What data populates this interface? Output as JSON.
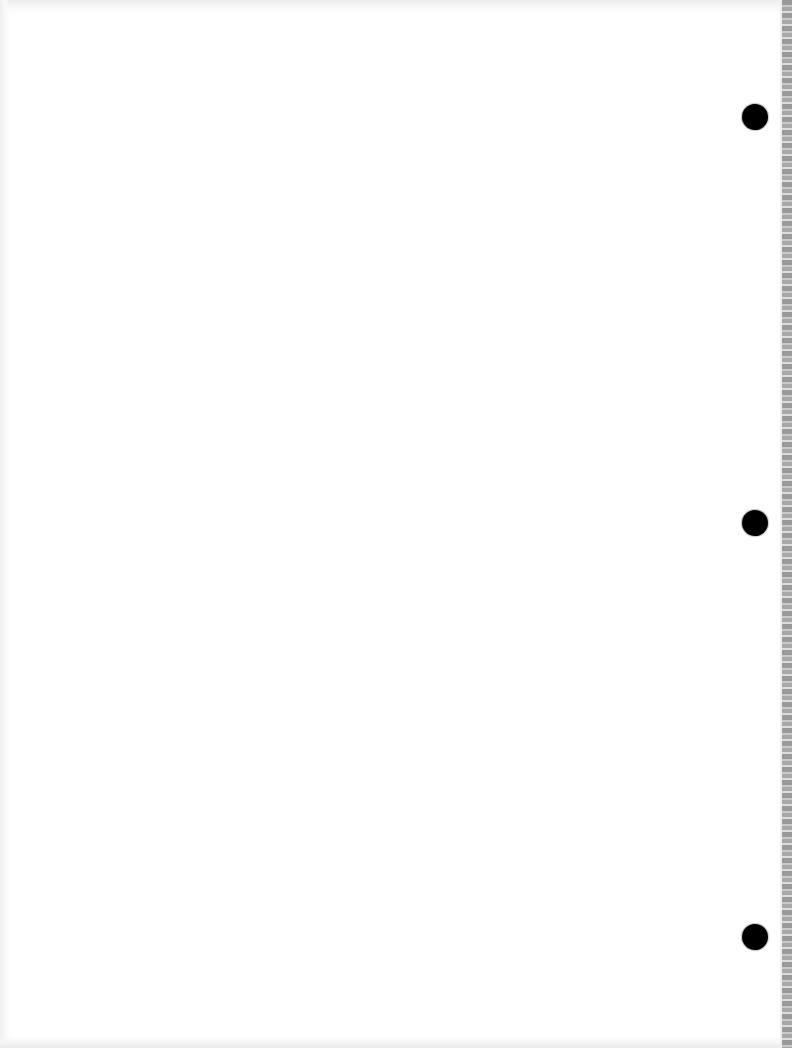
{
  "document": {
    "type": "blank loose-leaf notebook page (scanned)",
    "text_content": "",
    "background_color": "#ffffff"
  },
  "punch_holes": [
    {
      "cx": 755,
      "cy": 117,
      "r": 13,
      "color": "#000000"
    },
    {
      "cx": 755,
      "cy": 523,
      "r": 13,
      "color": "#000000"
    },
    {
      "cx": 755,
      "cy": 937,
      "r": 13,
      "color": "#000000"
    }
  ],
  "perforated_edge": {
    "side": "right",
    "width_px": 12,
    "color": "#9a9a9a"
  }
}
